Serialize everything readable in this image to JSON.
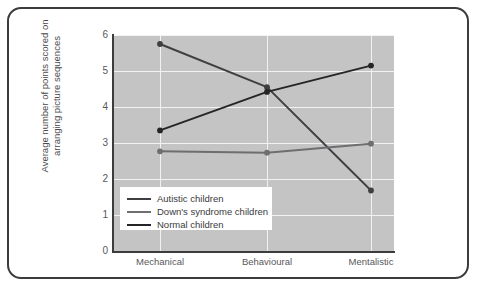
{
  "figure": {
    "border_color": "#3c3c3e",
    "background": "#ffffff"
  },
  "chart_data": {
    "type": "line",
    "title": "",
    "xlabel": "",
    "ylabel": "Average number of points scored on arranging picture sequences",
    "ylabel_line1": "Average number of points scored on",
    "ylabel_line2": "arranging picture sequences",
    "categories": [
      "Mechanical",
      "Behavioural",
      "Mentalistic"
    ],
    "ylim": [
      0,
      6
    ],
    "yticks": [
      0,
      1,
      2,
      3,
      4,
      5,
      6
    ],
    "ytick_labels": [
      "0",
      "1",
      "2",
      "3",
      "4",
      "5",
      "6"
    ],
    "grid": true,
    "grid_color": "#f2f2f2",
    "plot_background": "#c4c4c4",
    "legend_position": "lower left",
    "series": [
      {
        "name": "Autistic children",
        "values": [
          5.75,
          4.55,
          1.68
        ],
        "color": "#3f3f41",
        "marker": "circle"
      },
      {
        "name": "Down's syndrome children",
        "values": [
          2.77,
          2.73,
          2.98
        ],
        "color": "#6e6e70",
        "marker": "circle"
      },
      {
        "name": "Normal children",
        "values": [
          3.35,
          4.42,
          5.15
        ],
        "color": "#252527",
        "marker": "circle"
      }
    ]
  }
}
